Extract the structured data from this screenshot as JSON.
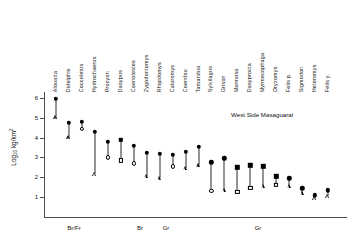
{
  "chart_data": {
    "type": "scatter",
    "title": "",
    "annotation": "West Side Masaguaral",
    "xlabel": "",
    "ylabel": "Log10 kg/km2",
    "ylabel_base": "Log",
    "ylabel_sub": "10",
    "ylabel_unit": "kg/km",
    "ylabel_sup": "2",
    "ylim": [
      0,
      6.3
    ],
    "yticks": [
      1,
      2,
      3,
      4,
      5,
      6
    ],
    "ytick_labels": [
      "1",
      "2",
      "3",
      "4",
      "5",
      "6"
    ],
    "grid": false,
    "legend": "none",
    "categories": [
      "Alouatta",
      "Didelphis",
      "Coccoletus",
      "Hydrochaerus",
      "Procyon",
      "Dasypus",
      "Caenolestes",
      "Zygodontomys",
      "Rhipidomys",
      "Caluromys",
      "Coendou",
      "Tamandua",
      "Sylvilagus",
      "Grison",
      "Marmosa",
      "Dasyprocta",
      "Myrmecophaga",
      "Oryzomys",
      "Felis p.",
      "Sigmodon",
      "Heteromys",
      "Felis y."
    ],
    "series": [
      {
        "name": "upper estimate",
        "marker": "filled",
        "values": [
          5.95,
          4.75,
          4.8,
          4.3,
          3.8,
          3.9,
          3.6,
          3.25,
          3.2,
          3.15,
          3.3,
          3.55,
          2.75,
          2.95,
          2.5,
          2.6,
          2.55,
          2.05,
          1.95,
          1.45,
          1.1,
          1.35
        ]
      },
      {
        "name": "lower estimate",
        "marker": "open",
        "values": [
          5.0,
          4.0,
          4.45,
          2.15,
          3.0,
          2.85,
          2.7,
          2.05,
          1.95,
          2.55,
          2.45,
          2.6,
          1.3,
          1.35,
          1.25,
          1.45,
          1.55,
          1.6,
          1.55,
          1.2,
          0.95,
          1.05
        ]
      }
    ],
    "upper_marker_shapes": [
      "filled-circle",
      "filled-circle",
      "filled-circle",
      "filled-circle",
      "filled-circle",
      "filled-square",
      "filled-circle",
      "filled-circle",
      "filled-circle",
      "filled-circle",
      "filled-circle",
      "filled-circle",
      "filled-circle",
      "filled-circle",
      "filled-square",
      "filled-square",
      "filled-square",
      "filled-square",
      "filled-circle",
      "filled-circle",
      "filled-circle",
      "filled-circle"
    ],
    "lower_marker_shapes": [
      "open-triangle",
      "open-triangle",
      "open-circle",
      "open-triangle",
      "open-circle",
      "open-square",
      "open-circle",
      "open-triangle",
      "open-triangle",
      "open-circle",
      "open-triangle",
      "open-triangle",
      "open-circle",
      "open-triangle",
      "open-square",
      "open-square",
      "open-triangle",
      "open-square",
      "open-triangle",
      "open-triangle",
      "open-triangle",
      "open-triangle"
    ],
    "guilds": [
      {
        "label": "Br/Fr",
        "x_center": 74
      },
      {
        "label": "Br",
        "x_center": 140
      },
      {
        "label": "Gr",
        "x_center": 166
      },
      {
        "label": "Gr",
        "x_center": 258
      }
    ]
  }
}
